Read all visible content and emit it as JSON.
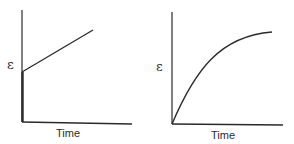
{
  "panels": [
    {
      "id": "left",
      "description": "Instantaneous elastic strain followed by linear creep",
      "y_label": "ε",
      "x_label": "Time"
    },
    {
      "id": "right",
      "description": "Delayed elastic (viscoelastic) strain rising asymptotically",
      "y_label": "ε",
      "x_label": "Time"
    }
  ],
  "colors": {
    "line": "#2a2a2a",
    "background": "#ffffff"
  }
}
